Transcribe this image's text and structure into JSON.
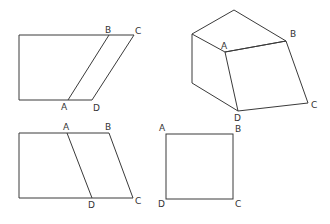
{
  "figures": [
    {
      "id": "fig-top-left",
      "description": "rectangle extended by parallelogram slice ABCD",
      "labels": {
        "A": "A",
        "B": "B",
        "C": "C",
        "D": "D"
      }
    },
    {
      "id": "fig-top-right",
      "description": "3D prism with labeled face ABCD",
      "labels": {
        "A": "A",
        "B": "B",
        "C": "C",
        "D": "D"
      }
    },
    {
      "id": "fig-bottom-left",
      "description": "rectangle with parallelogram ABCD",
      "labels": {
        "A": "A",
        "B": "B",
        "C": "C",
        "D": "D"
      }
    },
    {
      "id": "fig-bottom-right",
      "description": "square ABCD",
      "labels": {
        "A": "A",
        "B": "B",
        "C": "C",
        "D": "D"
      }
    }
  ],
  "colors": {
    "line": "#3a3a3a",
    "background": "#ffffff"
  }
}
